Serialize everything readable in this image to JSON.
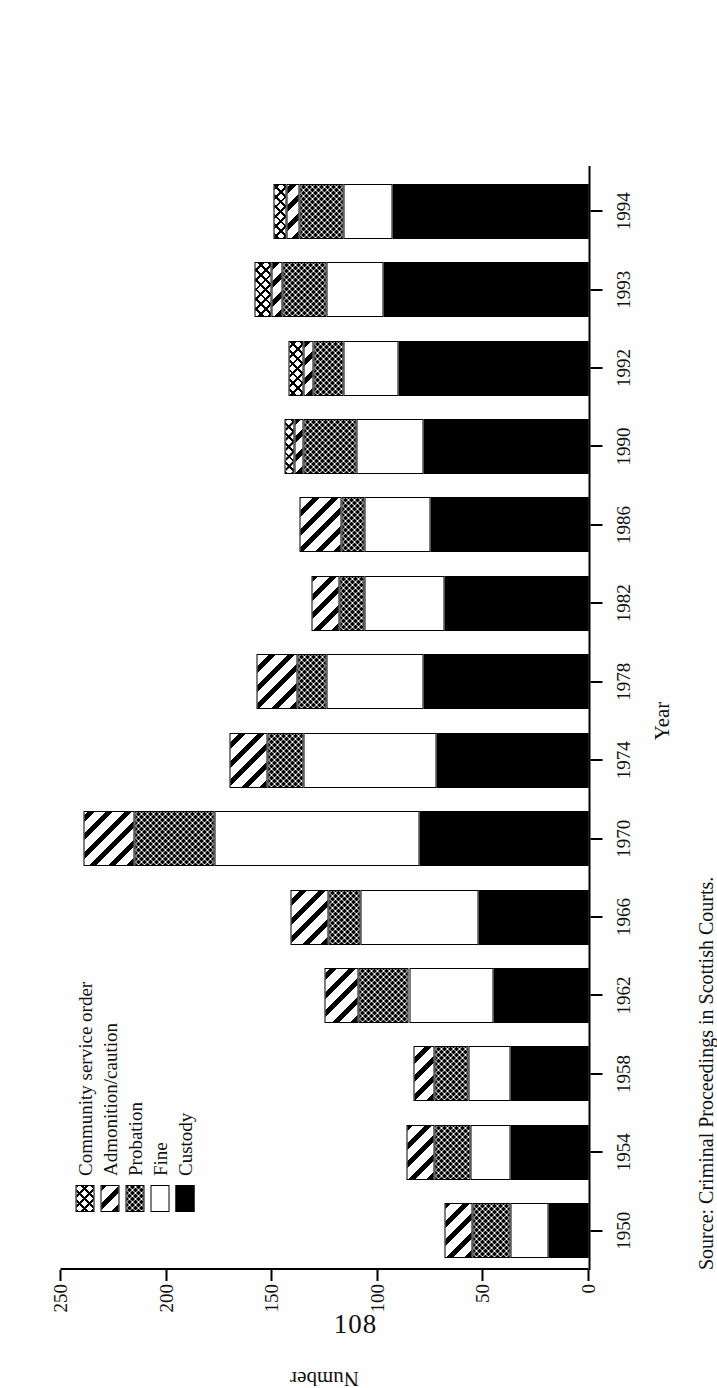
{
  "page": {
    "folio": "108"
  },
  "figure": {
    "source_prefix": "Source:",
    "source_text": "Criminal Proceedings in Scottish Courts.",
    "source_full": "Source:   Criminal Proceedings in Scottish Courts."
  },
  "legend": {
    "items": [
      {
        "label": "Community service order",
        "key": "cso",
        "pattern": "cross-hatch-fine"
      },
      {
        "label": "Admonition/caution",
        "key": "admonition",
        "pattern": "diagonal-hatch"
      },
      {
        "label": "Probation",
        "key": "probation",
        "pattern": "dotted-stipple"
      },
      {
        "label": "Fine",
        "key": "fine",
        "pattern": "white-solid"
      },
      {
        "label": "Custody",
        "key": "custody",
        "pattern": "black-solid"
      }
    ]
  },
  "chart_data": {
    "type": "bar",
    "orientation": "vertical-stacked",
    "title": "",
    "xlabel": "Year",
    "ylabel": "Number",
    "ylim": [
      0,
      250
    ],
    "yticks": [
      0,
      50,
      100,
      150,
      200,
      250
    ],
    "ytick_labels": [
      "0",
      "50",
      "100",
      "150",
      "200",
      "250"
    ],
    "grid": false,
    "legend_position": "top-left",
    "stack_order_bottom_to_top": [
      "Custody",
      "Fine",
      "Probation",
      "Admonition/caution",
      "Community service order"
    ],
    "categories": [
      "1950",
      "1954",
      "1958",
      "1962",
      "1966",
      "1970",
      "1974",
      "1978",
      "1982",
      "1986",
      "1990",
      "1992",
      "1993",
      "1994"
    ],
    "series": [
      {
        "name": "Custody",
        "values": [
          19,
          37,
          37,
          45,
          52,
          80,
          72,
          78,
          68,
          75,
          78,
          90,
          97,
          93
        ]
      },
      {
        "name": "Fine",
        "values": [
          18,
          19,
          20,
          40,
          56,
          97,
          63,
          46,
          38,
          31,
          32,
          26,
          27,
          23
        ]
      },
      {
        "name": "Probation",
        "values": [
          18,
          17,
          16,
          24,
          15,
          38,
          17,
          14,
          12,
          11,
          25,
          14,
          21,
          21
        ]
      },
      {
        "name": "Admonition/caution",
        "values": [
          13,
          13,
          10,
          16,
          18,
          24,
          18,
          19,
          13,
          20,
          4,
          5,
          5,
          6
        ]
      },
      {
        "name": "Community service order",
        "values": [
          0,
          0,
          0,
          0,
          0,
          0,
          0,
          0,
          0,
          0,
          5,
          7,
          8,
          6
        ]
      }
    ],
    "totals": [
      68,
      86,
      83,
      125,
      141,
      239,
      170,
      157,
      131,
      137,
      144,
      142,
      158,
      149
    ]
  },
  "colors": {
    "ink": "#000000",
    "paper": "#ffffff"
  }
}
